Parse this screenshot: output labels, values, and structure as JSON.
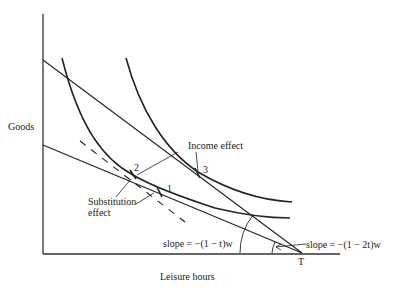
{
  "diagram": {
    "type": "labor-leisure tax diagram",
    "axes": {
      "y_label": "Goods",
      "x_label": "Leisure hours",
      "x_endpoint_label": "T"
    },
    "points": [
      {
        "id": "1",
        "label": "1"
      },
      {
        "id": "2",
        "label": "2"
      },
      {
        "id": "3",
        "label": "3"
      }
    ],
    "annotations": {
      "income_effect": "Income effect",
      "substitution_effect_line1": "Substitution",
      "substitution_effect_line2": "effect",
      "slope_upper": "slope = −(1 − t)w",
      "slope_lower": "slope = −(1 − 2t)w"
    },
    "curves": [
      {
        "name": "budget-line-t",
        "style": "solid"
      },
      {
        "name": "budget-line-2t",
        "style": "solid"
      },
      {
        "name": "compensated-budget-line",
        "style": "dashed"
      },
      {
        "name": "indifference-curve-low",
        "style": "solid"
      },
      {
        "name": "indifference-curve-high",
        "style": "solid"
      }
    ],
    "colors": {
      "line": "#222222",
      "background": "#ffffff"
    }
  }
}
